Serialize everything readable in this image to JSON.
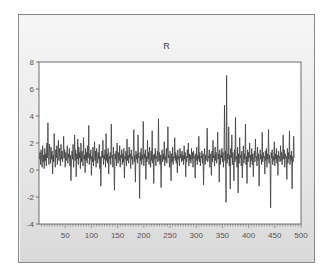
{
  "chart_data": {
    "type": "line",
    "title": "R",
    "xlabel": "",
    "ylabel": "",
    "xlim": [
      1,
      500
    ],
    "ylim": [
      -4,
      8
    ],
    "x_ticks": [
      50,
      100,
      150,
      200,
      250,
      300,
      350,
      400,
      450,
      500
    ],
    "y_ticks": [
      -4,
      -2,
      0,
      2,
      4,
      6,
      8
    ],
    "grid": false,
    "legend": null,
    "line_color": "#3c3c3c",
    "series": [
      {
        "name": "R",
        "x_start": 1,
        "x_step": 1,
        "values": [
          0.8,
          1.3,
          0.4,
          1.5,
          0.9,
          0.2,
          1.8,
          0.6,
          1.1,
          0.1,
          1.6,
          0.7,
          1.2,
          0.3,
          2.0,
          0.9,
          3.5,
          1.0,
          0.4,
          1.9,
          1.2,
          0.5,
          1.7,
          0.8,
          1.4,
          -0.3,
          1.1,
          0.6,
          2.7,
          1.3,
          0.2,
          1.5,
          0.9,
          1.8,
          0.4,
          1.2,
          2.2,
          0.7,
          1.6,
          1.0,
          0.3,
          1.9,
          0.8,
          1.4,
          0.6,
          1.1,
          2.5,
          0.9,
          1.5,
          0.2,
          1.3,
          0.7,
          1.0,
          1.8,
          0.5,
          1.2,
          0.9,
          1.6,
          0.3,
          1.1,
          -0.8,
          0.6,
          1.4,
          0.8,
          1.9,
          0.2,
          1.0,
          2.6,
          0.7,
          1.5,
          -0.5,
          1.2,
          0.8,
          2.3,
          0.4,
          1.7,
          0.9,
          1.3,
          0.1,
          2.0,
          0.6,
          1.4,
          1.0,
          0.3,
          2.4,
          0.8,
          1.1,
          -0.2,
          1.6,
          0.7,
          1.3,
          0.5,
          1.8,
          0.9,
          3.3,
          0.4,
          1.2,
          0.8,
          1.5,
          -0.4,
          1.0,
          0.6,
          1.7,
          0.3,
          1.1,
          2.1,
          0.7,
          1.4,
          0.2,
          1.6,
          0.9,
          0.5,
          1.3,
          0.8,
          1.9,
          0.1,
          1.0,
          -1.2,
          0.6,
          1.4,
          0.9,
          2.2,
          0.4,
          1.1,
          0.8,
          1.5,
          0.2,
          2.7,
          0.7,
          1.2,
          0.5,
          1.6,
          -0.3,
          1.0,
          0.8,
          1.3,
          0.4,
          3.4,
          0.9,
          1.1,
          0.2,
          1.7,
          0.6,
          -1.5,
          1.2,
          0.8,
          1.4,
          0.3,
          2.0,
          1.0,
          0.5,
          1.3,
          0.7,
          1.8,
          0.2,
          1.1,
          0.9,
          1.5,
          0.4,
          1.2,
          0.6,
          1.6,
          -0.6,
          1.0,
          0.8,
          1.4,
          0.3,
          2.3,
          0.7,
          1.1,
          0.5,
          1.7,
          0.9,
          1.2,
          0.1,
          1.5,
          0.8,
          1.0,
          0.4,
          1.3,
          3.0,
          0.6,
          1.1,
          -0.9,
          1.4,
          0.8,
          1.2,
          0.5,
          2.6,
          0.9,
          1.0,
          -2.1,
          1.3,
          0.7,
          1.6,
          0.4,
          1.1,
          0.8,
          3.6,
          0.3,
          1.2,
          0.9,
          1.5,
          -0.7,
          1.0,
          0.6,
          2.2,
          0.8,
          1.3,
          0.4,
          1.7,
          1.0,
          0.2,
          1.4,
          0.7,
          2.9,
          0.5,
          1.1,
          -1.0,
          1.2,
          0.8,
          1.6,
          0.3,
          1.0,
          0.9,
          1.4,
          0.6,
          3.8,
          0.7,
          1.3,
          0.4,
          1.1,
          -1.3,
          0.9,
          1.5,
          0.6,
          1.2,
          0.8,
          2.1,
          0.3,
          1.0,
          0.7,
          1.6,
          0.5,
          1.3,
          3.2,
          0.9,
          1.1,
          0.2,
          1.4,
          0.8,
          -0.8,
          1.2,
          0.6,
          1.7,
          0.4,
          1.0,
          0.9,
          2.4,
          0.7,
          1.3,
          0.5,
          1.1,
          -0.2,
          1.5,
          0.8,
          1.0,
          0.3,
          1.6,
          0.9,
          1.2,
          0.6,
          1.4,
          0.7,
          1.1,
          0.4,
          1.8,
          0.8,
          1.3,
          -0.5,
          1.0,
          0.6,
          1.5,
          0.9,
          2.0,
          0.3,
          1.2,
          0.7,
          1.1,
          0.5,
          1.6,
          0.8,
          1.3,
          0.2,
          1.4,
          0.9,
          1.0,
          -0.6,
          1.2,
          0.7,
          1.7,
          0.4,
          1.1,
          0.8,
          2.5,
          0.6,
          1.3,
          0.3,
          1.0,
          0.9,
          1.4,
          0.5,
          1.2,
          -1.1,
          0.8,
          1.6,
          0.4,
          1.1,
          0.7,
          1.3,
          3.1,
          0.6,
          1.0,
          0.9,
          1.5,
          0.2,
          1.2,
          0.8,
          -0.4,
          1.4,
          0.6,
          2.2,
          0.9,
          1.1,
          0.3,
          1.7,
          0.7,
          1.3,
          0.5,
          1.0,
          2.8,
          0.8,
          1.2,
          -0.9,
          1.5,
          0.4,
          1.1,
          0.9,
          1.6,
          0.6,
          1.3,
          0.2,
          1.0,
          4.8,
          0.7,
          1.4,
          -2.4,
          7.0,
          0.5,
          1.2,
          0.8,
          3.2,
          0.3,
          1.1,
          -1.4,
          1.6,
          0.9,
          2.6,
          0.4,
          1.3,
          0.7,
          -0.8,
          1.5,
          0.6,
          3.9,
          0.8,
          1.0,
          0.2,
          1.7,
          -1.7,
          1.2,
          0.5,
          2.4,
          0.9,
          1.1,
          0.3,
          1.4,
          -0.6,
          0.7,
          1.8,
          0.5,
          1.2,
          0.8,
          3.4,
          0.4,
          1.0,
          -1.0,
          1.5,
          0.6,
          1.3,
          0.9,
          2.0,
          0.2,
          1.1,
          0.7,
          1.6,
          0.4,
          1.2,
          -0.5,
          0.8,
          1.4,
          0.6,
          2.3,
          0.9,
          1.0,
          0.3,
          1.7,
          0.7,
          1.2,
          -1.2,
          0.5,
          1.5,
          0.8,
          1.1,
          0.4,
          2.8,
          0.6,
          1.3,
          0.9,
          1.0,
          -0.3,
          1.4,
          0.7,
          1.6,
          0.2,
          1.2,
          0.8,
          3.0,
          0.5,
          1.1,
          0.6,
          -2.8,
          1.3,
          0.9,
          1.5,
          0.4,
          1.0,
          0.7,
          2.1,
          0.3,
          1.2,
          0.8,
          1.6,
          0.5,
          1.1,
          -0.4,
          1.4,
          0.9,
          1.0,
          0.6,
          1.8,
          0.7,
          1.3,
          0.4,
          1.1,
          2.6,
          0.8,
          1.5,
          0.2,
          1.2,
          0.9,
          1.0,
          -0.7,
          1.6,
          0.5,
          1.3,
          0.8,
          2.9,
          0.4,
          1.1,
          0.7,
          1.4,
          -1.4,
          1.0,
          0.6,
          2.5,
          0.9
        ]
      }
    ]
  }
}
